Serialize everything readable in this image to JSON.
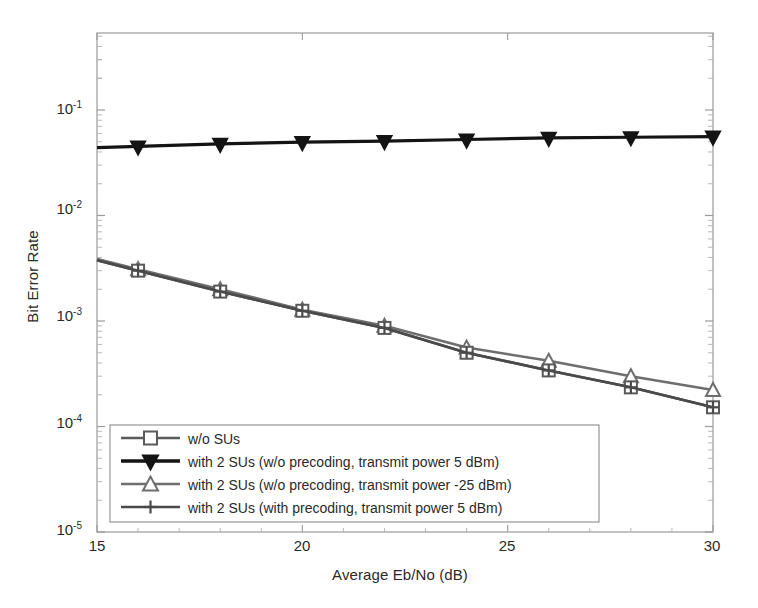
{
  "chart_data": {
    "type": "line",
    "title": "",
    "xlabel": "Average Eb/No (dB)",
    "ylabel": "Bit Error Rate",
    "xlim": [
      15,
      30
    ],
    "ylim": [
      1e-05,
      0.3
    ],
    "yscale": "log",
    "grid": false,
    "legend_position": "lower-left-inside",
    "xticks": [
      "15",
      "20",
      "25",
      "30"
    ],
    "xtick_values": [
      15,
      20,
      25,
      30
    ],
    "yticks": [
      "10-1",
      "10-2",
      "10-3",
      "10-4",
      "10-5"
    ],
    "ytick_values": [
      0.1,
      0.01,
      0.001,
      0.0001,
      1e-05
    ],
    "ytick_mantissa": [
      "10",
      "10",
      "10",
      "10",
      "10"
    ],
    "ytick_exponent": [
      "-1",
      "-2",
      "-3",
      "-4",
      "-5"
    ],
    "x": [
      16,
      18,
      20,
      22,
      24,
      26,
      28,
      30
    ],
    "series": [
      {
        "name": "w/o SUs",
        "marker": "square",
        "color": "#5a5a5a",
        "values": [
          0.003,
          0.0019,
          0.00125,
          0.00086,
          0.0005,
          0.00034,
          0.000235,
          0.000152
        ]
      },
      {
        "name": "with 2 SUs (w/o precoding, transmit power 5 dBm)",
        "marker": "triangle-down",
        "color": "#141414",
        "values": [
          0.0452,
          0.0478,
          0.0497,
          0.0508,
          0.0525,
          0.0545,
          0.0552,
          0.056
        ]
      },
      {
        "name": "with 2 SUs (w/o precoding, transmit power -25 dBm)",
        "marker": "triangle-up",
        "color": "#6e6e6e",
        "values": [
          0.0031,
          0.002,
          0.00128,
          0.0009,
          0.00056,
          0.00042,
          0.0003,
          0.000222
        ]
      },
      {
        "name": "with 2 SUs (with precoding, transmit power 5 dBm)",
        "marker": "plus",
        "color": "#4a4a4a",
        "values": [
          0.003,
          0.0019,
          0.00125,
          0.00086,
          0.0005,
          0.00034,
          0.000235,
          0.000152
        ]
      }
    ]
  },
  "legend": {
    "items": [
      {
        "label": "w/o SUs"
      },
      {
        "label": "with 2 SUs (w/o precoding, transmit power 5 dBm)"
      },
      {
        "label": "with 2 SUs (w/o precoding, transmit power -25 dBm)"
      },
      {
        "label": "with 2 SUs (with precoding, transmit power 5 dBm)"
      }
    ]
  },
  "style": {
    "axis_color": "#8c8c8c",
    "background": "#ffffff",
    "text_color": "#2a2a2a"
  }
}
